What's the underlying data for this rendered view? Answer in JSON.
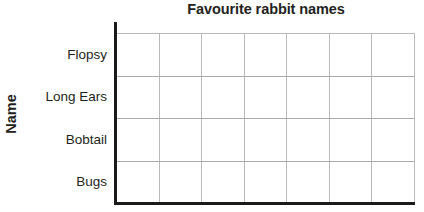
{
  "chart_data": {
    "type": "bar",
    "orientation": "horizontal",
    "title": "Favourite rabbit names",
    "xlabel": "",
    "ylabel": "Name",
    "categories": [
      "Flopsy",
      "Long Ears",
      "Bobtail",
      "Bugs"
    ],
    "values": [
      null,
      null,
      null,
      null
    ],
    "series": [],
    "grid": true,
    "grid_columns": 7,
    "grid_rows": 4,
    "legend": "none",
    "xtick_labels": [],
    "note": "Blank worksheet grid - no bars drawn",
    "colors": {
      "text": "#231f20",
      "axis": "#1a1a1a",
      "gridline": "#b9b9b9",
      "background": "#ffffff"
    }
  },
  "chart": {
    "title": "Favourite rabbit names",
    "y_axis_title": "Name",
    "categories": [
      {
        "label": "Flopsy"
      },
      {
        "label": "Long Ears"
      },
      {
        "label": "Bobtail"
      },
      {
        "label": "Bugs"
      }
    ],
    "columns": [
      {
        "index": "1"
      },
      {
        "index": "2"
      },
      {
        "index": "3"
      },
      {
        "index": "4"
      },
      {
        "index": "5"
      },
      {
        "index": "6"
      },
      {
        "index": "7"
      }
    ]
  }
}
